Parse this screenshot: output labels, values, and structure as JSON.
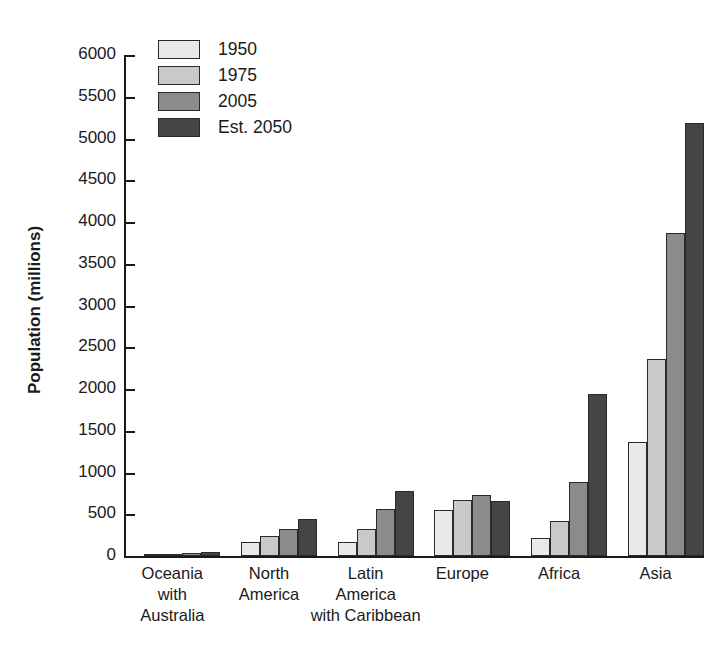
{
  "chart_data": {
    "type": "bar",
    "title": "",
    "xlabel": "",
    "ylabel": "Population (millions)",
    "ylim": [
      0,
      6000
    ],
    "ytick_step": 500,
    "yticks": [
      0,
      500,
      1000,
      1500,
      2000,
      2500,
      3000,
      3500,
      4000,
      4500,
      5000,
      5500,
      6000
    ],
    "ytick_labels": [
      "0",
      "500",
      "1000",
      "1500",
      "2000",
      "2500",
      "3000",
      "3500",
      "4000",
      "4500",
      "5000",
      "5500",
      "6000"
    ],
    "grid": false,
    "legend_position": "top-left",
    "categories": [
      "Oceania\nwith\nAustralia",
      "North\nAmerica",
      "Latin\nAmerica\nwith Caribbean",
      "Europe",
      "Africa",
      "Asia"
    ],
    "category_lines": [
      [
        "Oceania",
        "with",
        "Australia"
      ],
      [
        "North",
        "America"
      ],
      [
        "Latin",
        "America",
        "with Caribbean"
      ],
      [
        "Europe"
      ],
      [
        "Africa"
      ],
      [
        "Asia"
      ]
    ],
    "series": [
      {
        "name": "1950",
        "color": "#e9e9e9",
        "values": [
          13,
          172,
          167,
          547,
          221,
          1370
        ]
      },
      {
        "name": "1975",
        "color": "#c9c9c9",
        "values": [
          21,
          243,
          322,
          676,
          416,
          2365
        ]
      },
      {
        "name": "2005",
        "color": "#8b8b8b",
        "values": [
          33,
          329,
          558,
          728,
          888,
          3870
        ]
      },
      {
        "name": "Est. 2050",
        "color": "#454545",
        "values": [
          47,
          438,
          783,
          653,
          1937,
          5180
        ]
      }
    ]
  },
  "legend": {
    "items": [
      {
        "label": "1950"
      },
      {
        "label": "1975"
      },
      {
        "label": "2005"
      },
      {
        "label": "Est. 2050"
      }
    ]
  },
  "axis": {
    "y_title": "Population (millions)"
  }
}
